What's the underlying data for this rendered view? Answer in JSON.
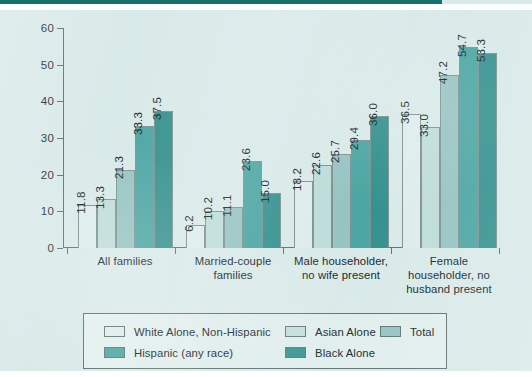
{
  "chart_data": {
    "type": "bar",
    "title": "",
    "subtitle": "",
    "xlabel": "",
    "ylabel": "",
    "ylim": [
      0,
      60
    ],
    "yticks": [
      0,
      10,
      20,
      30,
      40,
      50,
      60
    ],
    "ytick_labels": [
      "0",
      "10",
      "20",
      "30",
      "40",
      "50",
      "60"
    ],
    "grid": false,
    "legend_position": "bottom",
    "categories": [
      "All families",
      "Married-couple families",
      "Male householder, no wife present",
      "Female householder, no husband present"
    ],
    "category_lines": [
      [
        "All families"
      ],
      [
        "Married-couple",
        "families"
      ],
      [
        "Male householder,",
        "no wife present"
      ],
      [
        "Female",
        "householder, no",
        "husband present"
      ]
    ],
    "series": [
      {
        "name": "White Alone, Non-Hispanic",
        "color": "#dcecea",
        "values": [
          11.8,
          6.2,
          18.2,
          36.5
        ]
      },
      {
        "name": "Asian Alone",
        "color": "#bcdbd8",
        "values": [
          13.3,
          10.2,
          22.6,
          33.0
        ]
      },
      {
        "name": "Total",
        "color": "#93c2c1",
        "values": [
          21.3,
          11.1,
          25.7,
          47.2
        ]
      },
      {
        "name": "Hispanic (any race)",
        "color": "#47a3a0",
        "values": [
          33.3,
          23.6,
          29.4,
          54.7
        ]
      },
      {
        "name": "Black Alone",
        "color": "#2f8e8b",
        "values": [
          37.5,
          15.0,
          36.0,
          53.3
        ]
      }
    ],
    "data_labels": [
      [
        "11.8",
        "13.3",
        "21.3",
        "33.3",
        "37.5"
      ],
      [
        "6.2",
        "10.2",
        "11.1",
        "23.6",
        "15.0"
      ],
      [
        "18.2",
        "22.6",
        "25.7",
        "29.4",
        "36.0"
      ],
      [
        "36.5",
        "33.0",
        "47.2",
        "54.7",
        "53.3"
      ]
    ]
  },
  "legend": {
    "column1": [
      {
        "label": "White Alone, Non-Hispanic",
        "color": "#dcecea"
      },
      {
        "label": "Hispanic (any race)",
        "color": "#47a3a0"
      }
    ],
    "column2": [
      {
        "label": "Asian Alone",
        "color": "#bcdbd8"
      },
      {
        "label": "Black Alone",
        "color": "#2f8e8b"
      }
    ],
    "column3": [
      {
        "label": "Total",
        "color": "#93c2c1"
      }
    ]
  },
  "theme": {
    "panel_background": "#d7e9e8",
    "top_rule": "#17706e",
    "axis": "#5c6c6c",
    "text": "#10201f"
  }
}
